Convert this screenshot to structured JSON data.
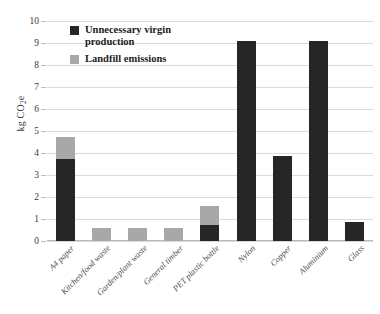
{
  "chart_data": {
    "type": "bar",
    "subtype": "stacked-bar",
    "title": "",
    "xlabel": "",
    "ylabel": "kg CO2e",
    "ylabel_rich": "kg CO₂e",
    "ylim": [
      0,
      10
    ],
    "yticks": [
      0,
      1,
      2,
      3,
      4,
      5,
      6,
      7,
      8,
      9,
      10
    ],
    "grid": true,
    "legend_position": "top-left-inside",
    "categories": [
      "A4 paper",
      "Kitchen/food waste",
      "Garden/plant waste",
      "General timber",
      "PET plastic bottle",
      "Nylon",
      "Copper",
      "Aluminium",
      "Glass"
    ],
    "series": [
      {
        "name": "Unnecessary virgin production",
        "color": "#262626",
        "values": [
          3.75,
          0,
          0,
          0,
          0.75,
          9.1,
          3.85,
          9.1,
          0.85
        ]
      },
      {
        "name": "Landfill emissions",
        "color": "#a8a8a8",
        "values": [
          1.0,
          0.6,
          0.6,
          0.6,
          0.85,
          0,
          0,
          0,
          0
        ]
      }
    ],
    "totals": [
      4.75,
      0.6,
      0.6,
      0.6,
      1.6,
      9.1,
      3.85,
      9.1,
      0.85
    ]
  },
  "legend": {
    "items": [
      {
        "label": "Unnecessary virgin production",
        "color": "#262626"
      },
      {
        "label": "Landfill emissions",
        "color": "#a8a8a8"
      }
    ]
  }
}
